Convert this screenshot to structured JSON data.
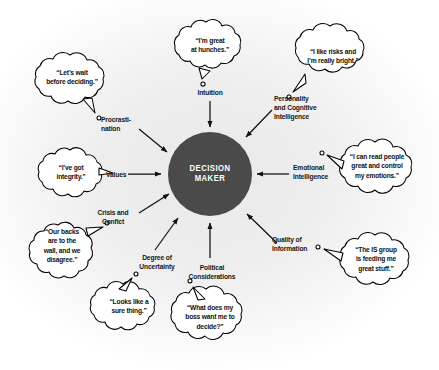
{
  "diagram": {
    "center": {
      "label": "DECISION\nMAKER"
    },
    "factors": [
      {
        "id": "intuition",
        "label": "Intuition",
        "quote": "“I’m great\nat hunches.”"
      },
      {
        "id": "personality",
        "label": "Personality\nand Cognitive\nIntelligence",
        "quote": "“I like risks and\nI’m really bright.”"
      },
      {
        "id": "emotional",
        "label": "Emotional\nIntelligence",
        "quote": "“I can read people\ngreat and control\nmy emotions.”"
      },
      {
        "id": "quality",
        "label": "Quality of\nInformation",
        "quote": "“The IS group\nis feeding me\ngreat stuff.”"
      },
      {
        "id": "political",
        "label": "Political\nConsiderations",
        "quote": "“What does my\nboss want me to\ndecide?”"
      },
      {
        "id": "uncertainty",
        "label": "Degree of\nUncertainty",
        "quote": "“Looks like a\nsure thing.”"
      },
      {
        "id": "crisis",
        "label": "Crisis and\nConfict",
        "quote": "“Our backs\nare to the\nwall, and we\ndisagree.”"
      },
      {
        "id": "values",
        "label": "Values",
        "quote": "“I’ve got\nintegrity.”"
      },
      {
        "id": "procrastination",
        "label": "Procrasti-\nnation",
        "quote": "“Let’s wait\nbefore deciding.”"
      }
    ],
    "colors": {
      "core_fill": "#4a4a4a",
      "core_text": "#ffffff",
      "label_text": "#161616",
      "bubble_fill": "#ffffff",
      "bubble_stroke": "#000000",
      "arrow": "#111111",
      "background": "#ffffff"
    }
  }
}
